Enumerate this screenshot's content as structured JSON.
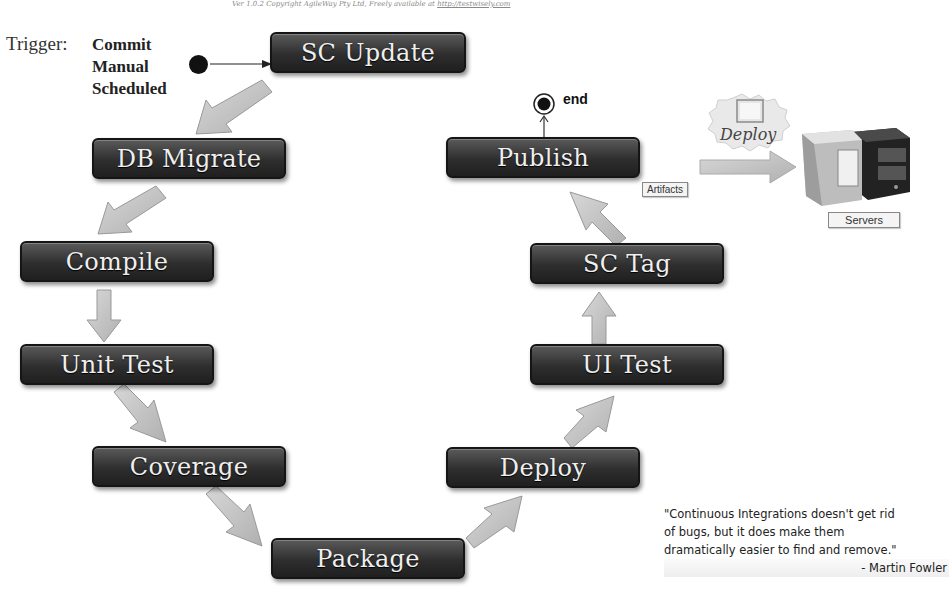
{
  "header": {
    "version_text": "Ver 1.0.2  Copyright AgileWay Pty Ltd, Freely available at",
    "version_link": "http://testwisely.com"
  },
  "trigger": {
    "label": "Trigger:",
    "options": [
      "Commit",
      "Manual",
      "Scheduled"
    ]
  },
  "steps": [
    {
      "id": "sc-update",
      "label": "SC Update"
    },
    {
      "id": "db-migrate",
      "label": "DB Migrate"
    },
    {
      "id": "compile",
      "label": "Compile"
    },
    {
      "id": "unit-test",
      "label": "Unit Test"
    },
    {
      "id": "coverage",
      "label": "Coverage"
    },
    {
      "id": "package",
      "label": "Package"
    },
    {
      "id": "deploy",
      "label": "Deploy"
    },
    {
      "id": "ui-test",
      "label": "UI Test"
    },
    {
      "id": "sc-tag",
      "label": "SC Tag"
    },
    {
      "id": "publish",
      "label": "Publish"
    }
  ],
  "end_label": "end",
  "artifacts_label": "Artifacts",
  "deploy_cloud_label": "Deploy",
  "servers_label": "Servers",
  "quote": {
    "lines": [
      "\"Continuous Integrations doesn't get rid",
      "of bugs,  but it does make them",
      "dramatically easier  to find and remove.\""
    ],
    "author": "- Martin Fowler"
  },
  "colors": {
    "step_bg": "#2e2e2e",
    "arrow_fill": "#c4c4c4",
    "arrow_stroke": "#9a9a9a",
    "background": "#ffffff"
  }
}
